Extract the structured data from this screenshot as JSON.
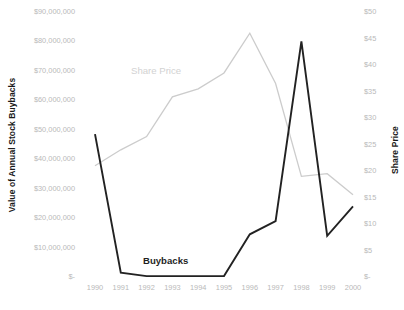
{
  "chart_data": {
    "type": "line",
    "title": "",
    "xlabel": "",
    "categories": [
      "1990",
      "1991",
      "1992",
      "1993",
      "1994",
      "1995",
      "1996",
      "1997",
      "1998",
      "1999",
      "2000"
    ],
    "grid": false,
    "legend_position": "inline-annotation",
    "series": [
      {
        "name": "Buybacks",
        "axis": "left",
        "color": "#222222",
        "values": [
          48500000,
          1500000,
          300000,
          300000,
          300000,
          300000,
          14500000,
          19000000,
          80000000,
          14000000,
          24000000
        ]
      },
      {
        "name": "Share Price",
        "axis": "right",
        "color": "#cccccc",
        "values": [
          21.0,
          24.0,
          26.5,
          34.0,
          35.5,
          38.5,
          46.0,
          36.5,
          19.0,
          19.5,
          15.5
        ]
      }
    ],
    "axes": {
      "left": {
        "label": "Value of Annual Stock Buybacks",
        "ylim": [
          0,
          90000000
        ],
        "ticks": [
          "$-",
          "$10,000,000",
          "$20,000,000",
          "$30,000,000",
          "$40,000,000",
          "$50,000,000",
          "$60,000,000",
          "$70,000,000",
          "$80,000,000",
          "$90,000,000"
        ],
        "tick_values": [
          0,
          10000000,
          20000000,
          30000000,
          40000000,
          50000000,
          60000000,
          70000000,
          80000000,
          90000000
        ]
      },
      "right": {
        "label": "Share Price",
        "ylim": [
          0,
          50
        ],
        "ticks": [
          "$-",
          "$5",
          "$10",
          "$15",
          "$20",
          "$25",
          "$30",
          "$35",
          "$40",
          "$45",
          "$50"
        ],
        "tick_values": [
          0,
          5,
          10,
          15,
          20,
          25,
          30,
          35,
          40,
          45,
          50
        ]
      }
    },
    "annotations": [
      {
        "text": "Share Price",
        "color": "#d2d2d2"
      },
      {
        "text": "Buybacks",
        "color": "#1f1f1f"
      }
    ]
  }
}
